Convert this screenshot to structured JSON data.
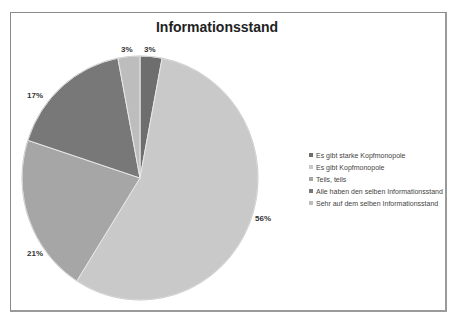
{
  "chart_data": {
    "type": "pie",
    "title": "Informationsstand",
    "categories": [
      "Es gibt starke Kopfmonopole",
      "Es gibt Kopfmonopole",
      "Teils, teils",
      "Alle haben den selben Informationsstand",
      "Sehr auf dem selben Informationsstand"
    ],
    "values": [
      3,
      56,
      21,
      17,
      3
    ],
    "labels": [
      "3%",
      "56%",
      "21%",
      "17%",
      "3%"
    ],
    "colors": [
      "#6e6e6e",
      "#c9c9c9",
      "#a6a6a6",
      "#787878",
      "#bdbdbd"
    ],
    "legend_position": "right",
    "start_angle_deg": 0,
    "direction": "clockwise"
  },
  "title": "Informationsstand",
  "legend": {
    "items": [
      {
        "label": "Es gibt starke Kopfmonopole",
        "color": "#6e6e6e"
      },
      {
        "label": "Es gibt Kopfmonopole",
        "color": "#c9c9c9"
      },
      {
        "label": "Teils, teils",
        "color": "#a6a6a6"
      },
      {
        "label": "Alle haben den selben Informationsstand",
        "color": "#787878"
      },
      {
        "label": "Sehr auf dem selben Informationsstand",
        "color": "#bdbdbd"
      }
    ]
  },
  "data_labels": [
    {
      "text": "3%",
      "x": 121,
      "y": 45
    },
    {
      "text": "56%",
      "x": 255,
      "y": 214
    },
    {
      "text": "21%",
      "x": 27,
      "y": 249
    },
    {
      "text": "17%",
      "x": 27,
      "y": 91
    },
    {
      "text": "3%",
      "x": 144,
      "y": 45
    }
  ]
}
